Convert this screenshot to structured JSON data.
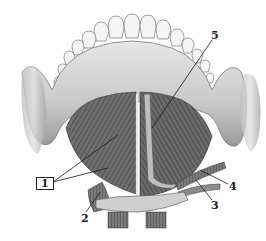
{
  "figure": {
    "colors": {
      "background": "#ffffff",
      "bone": "#d4d4d4",
      "bone_shadow": "#8a8a8a",
      "muscle": "#6e6e6e",
      "muscle_dark": "#4a4a4a",
      "tooth": "#f4f4f4",
      "leader_line": "#1a1a1a"
    }
  },
  "labels": [
    {
      "id": "1",
      "text": "1",
      "boxed": true,
      "x": 36,
      "y": 177
    },
    {
      "id": "2",
      "text": "2",
      "boxed": false,
      "x": 81,
      "y": 213
    },
    {
      "id": "3",
      "text": "3",
      "boxed": false,
      "x": 211,
      "y": 200
    },
    {
      "id": "4",
      "text": "4",
      "boxed": false,
      "x": 229,
      "y": 181
    },
    {
      "id": "5",
      "text": "5",
      "boxed": false,
      "x": 211,
      "y": 30
    }
  ]
}
